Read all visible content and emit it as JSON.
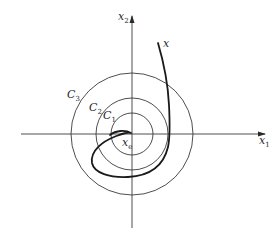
{
  "diagram": {
    "type": "phase-portrait-stability",
    "origin": {
      "x": 132,
      "y": 134
    },
    "axes": {
      "horizontal": {
        "label": "x",
        "subscript": "1",
        "x_start": 21,
        "x_end": 265,
        "y": 134
      },
      "vertical": {
        "label": "x",
        "subscript": "2",
        "y_start": 228,
        "y_end": 16,
        "x": 132
      }
    },
    "circles": [
      {
        "name": "C1",
        "label": "C",
        "subscript": "1",
        "radius": 21
      },
      {
        "name": "C2",
        "label": "C",
        "subscript": "2",
        "radius": 36
      },
      {
        "name": "C3",
        "label": "C",
        "subscript": "3",
        "radius": 61
      }
    ],
    "equilibrium": {
      "label": "x",
      "subscript": "e"
    },
    "trajectory": {
      "label": "x"
    },
    "colors": {
      "line": "#3a3a3a",
      "trajectory": "#1a1a1a",
      "background": "#ffffff"
    }
  }
}
